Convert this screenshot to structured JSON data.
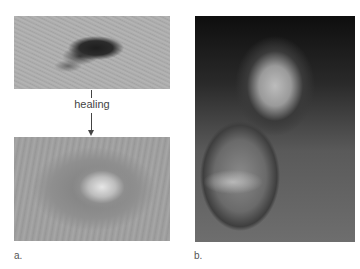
{
  "figure": {
    "panel_a": {
      "label": "a.",
      "top_photo": "wound-before-healing",
      "arrow_text": "healing",
      "bottom_photo": "scar-after-healing"
    },
    "panel_b": {
      "label": "b.",
      "photo": "earlobe-keloid"
    }
  }
}
